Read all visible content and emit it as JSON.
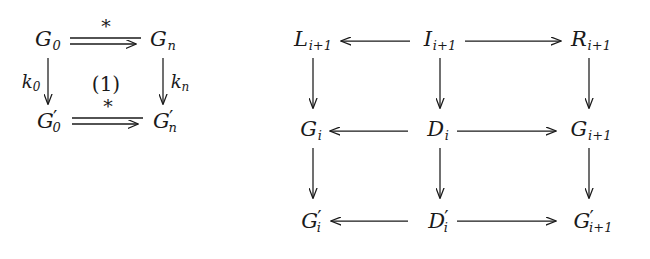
{
  "figure": {
    "kind": "commutative-diagram-pair",
    "background_color": "#ffffff",
    "ink_color": "#1a1a1a",
    "width": 650,
    "height": 259
  },
  "left_diagram": {
    "name": "square-diagram-1",
    "nodes": {
      "top_left": {
        "base": "G",
        "sub": "0",
        "prime": ""
      },
      "top_right": {
        "base": "G",
        "sub": "n",
        "prime": ""
      },
      "bottom_left": {
        "base": "G",
        "sub": "0",
        "prime": "′"
      },
      "bottom_right": {
        "base": "G",
        "sub": "n",
        "prime": "′"
      }
    },
    "edge_labels": {
      "top": "*",
      "bottom": "*",
      "left": {
        "base": "k",
        "sub": "0"
      },
      "right": {
        "base": "k",
        "sub": "n"
      }
    },
    "region_label": "(1)"
  },
  "right_diagram": {
    "name": "grid-diagram-2",
    "nodes": {
      "r1c1": {
        "base": "L",
        "sub": "i+1",
        "prime": ""
      },
      "r1c2": {
        "base": "I",
        "sub": "i+1",
        "prime": ""
      },
      "r1c3": {
        "base": "R",
        "sub": "i+1",
        "prime": ""
      },
      "r2c1": {
        "base": "G",
        "sub": "i",
        "prime": ""
      },
      "r2c2": {
        "base": "D",
        "sub": "i",
        "prime": ""
      },
      "r2c3": {
        "base": "G",
        "sub": "i+1",
        "prime": ""
      },
      "r3c1": {
        "base": "G",
        "sub": "i",
        "prime": "′"
      },
      "r3c2": {
        "base": "D",
        "sub": "i",
        "prime": "′"
      },
      "r3c3": {
        "base": "G",
        "sub": "i+1",
        "prime": "′"
      }
    }
  }
}
